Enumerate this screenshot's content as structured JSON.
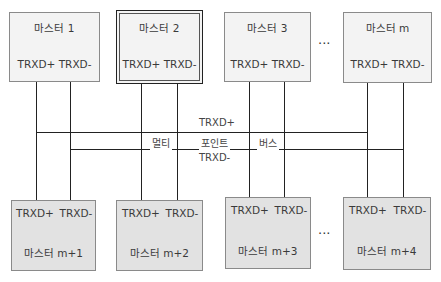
{
  "top_masters": [
    {
      "name": "마스터 1",
      "pins": "TRXD+ TRXD-"
    },
    {
      "name": "마스터 2",
      "pins": "TRXD+ TRXD-"
    },
    {
      "name": "마스터 3",
      "pins": "TRXD+ TRXD-"
    },
    {
      "name": "마스터 m",
      "pins": "TRXD+ TRXD-"
    }
  ],
  "bottom_masters": [
    {
      "name": "마스터 m+1",
      "pin_plus": "TRXD+",
      "pin_minus": "TRXD-"
    },
    {
      "name": "마스터 m+2",
      "pin_plus": "TRXD+",
      "pin_minus": "TRXD-"
    },
    {
      "name": "마스터 m+3",
      "pin_plus": "TRXD+",
      "pin_minus": "TRXD-"
    },
    {
      "name": "마스터 m+4",
      "pin_plus": "TRXD+",
      "pin_minus": "TRXD-"
    }
  ],
  "bus": {
    "plus_label": "TRXD+",
    "minus_label": "TRXD-",
    "title_words": [
      "멀티",
      "포인트",
      "버스"
    ]
  },
  "ellipsis": "···"
}
